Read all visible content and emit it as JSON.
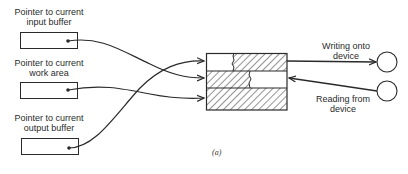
{
  "diagram": {
    "pointers": [
      {
        "line1": "Pointer to current",
        "line2": "input buffer"
      },
      {
        "line1": "Pointer to current",
        "line2": "work area"
      },
      {
        "line1": "Pointer to current",
        "line2": "output buffer"
      }
    ],
    "device_io": {
      "writing": {
        "line1": "Writing onto",
        "line2": "device"
      },
      "reading": {
        "line1": "Reading from",
        "line2": "device"
      }
    },
    "caption": "(a)",
    "colors": {
      "stroke": "#2a2a2a",
      "background": "#ffffff"
    }
  }
}
